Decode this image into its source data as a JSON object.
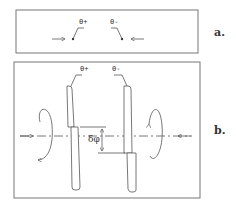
{
  "panels": {
    "a": {
      "label": "a.",
      "left_particle": "θ+",
      "right_particle": "θ-"
    },
    "b": {
      "label": "b.",
      "left_particle": "θ+",
      "right_particle": "θ-",
      "offset_label": "δφ"
    }
  },
  "colors": {
    "stroke": "#555555",
    "frame": "#777777",
    "label": "#333333"
  }
}
